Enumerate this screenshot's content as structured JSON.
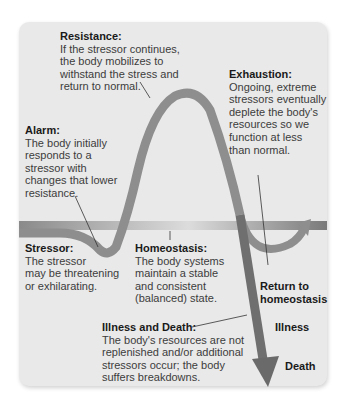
{
  "diagram": {
    "colors": {
      "panel_bg": "#e9e9e9",
      "curve": "#8e8e8e",
      "baseline": "#8a8a8a",
      "arrow_dark": "#6a6a6a",
      "text": "#3c3c3c",
      "heading": "#1a1a1a"
    },
    "stages": {
      "resistance": {
        "heading": "Resistance:",
        "lines": [
          "If the stressor continues,",
          "the body mobilizes to",
          "withstand the stress and",
          "return to normal."
        ]
      },
      "exhaustion": {
        "heading": "Exhaustion:",
        "lines": [
          "Ongoing, extreme",
          "stressors eventually",
          "deplete the body's",
          "resources so we",
          "function at less",
          "than normal."
        ]
      },
      "alarm": {
        "heading": "Alarm:",
        "lines": [
          "The body initially",
          "responds to a",
          "stressor with",
          "changes that lower",
          "resistance."
        ]
      },
      "stressor": {
        "heading": "Stressor:",
        "lines": [
          "The stressor",
          "may be threatening",
          "or exhilarating."
        ]
      },
      "homeostasis": {
        "heading": "Homeostasis:",
        "lines": [
          "The body systems",
          "maintain a stable",
          "and consistent",
          "(balanced) state."
        ]
      },
      "illness_death": {
        "heading": "Illness and Death:",
        "lines": [
          "The body's resources are not",
          "replenished and/or additional",
          "stressors occur; the body",
          "suffers breakdowns."
        ]
      }
    },
    "outcomes": {
      "return_line1": "Return to",
      "return_line2": "homeostasis",
      "illness": "Illness",
      "death": "Death"
    }
  }
}
